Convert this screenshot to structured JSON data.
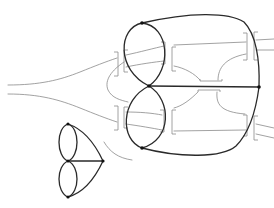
{
  "diagram": {
    "type": "graph-embedding-illustration",
    "colors": {
      "background": "#ffffff",
      "graph_edge": "#2a2a2a",
      "ribbon_edge": "#8a8a8a",
      "node": "#111111"
    },
    "large_figure": {
      "nodes": [
        {
          "id": "top",
          "x": 142,
          "y": 23
        },
        {
          "id": "center",
          "x": 149,
          "y": 86
        },
        {
          "id": "right",
          "x": 259,
          "y": 87
        },
        {
          "id": "bottom",
          "x": 142,
          "y": 148
        }
      ],
      "edges": [
        {
          "from": "top",
          "to": "center",
          "kind": "loop-left"
        },
        {
          "from": "top",
          "to": "center",
          "kind": "loop-right"
        },
        {
          "from": "center",
          "to": "bottom",
          "kind": "loop-left"
        },
        {
          "from": "center",
          "to": "bottom",
          "kind": "loop-right"
        },
        {
          "from": "center",
          "to": "right",
          "kind": "straight"
        },
        {
          "from": "top",
          "to": "right",
          "kind": "arc"
        },
        {
          "from": "bottom",
          "to": "right",
          "kind": "arc"
        }
      ],
      "has_ribbon_surface": true,
      "has_left_funnel": true
    },
    "small_figure": {
      "nodes": [
        {
          "id": "a",
          "x": 68,
          "y": 124
        },
        {
          "id": "b",
          "x": 68,
          "y": 161
        },
        {
          "id": "c",
          "x": 103,
          "y": 161
        },
        {
          "id": "d",
          "x": 68,
          "y": 197
        }
      ],
      "edges": [
        {
          "from": "a",
          "to": "b",
          "kind": "loop-left"
        },
        {
          "from": "a",
          "to": "b",
          "kind": "loop-right"
        },
        {
          "from": "b",
          "to": "d",
          "kind": "loop-left"
        },
        {
          "from": "b",
          "to": "d",
          "kind": "loop-right"
        },
        {
          "from": "b",
          "to": "c",
          "kind": "straight"
        },
        {
          "from": "a",
          "to": "c",
          "kind": "arc"
        },
        {
          "from": "d",
          "to": "c",
          "kind": "arc"
        }
      ]
    }
  }
}
